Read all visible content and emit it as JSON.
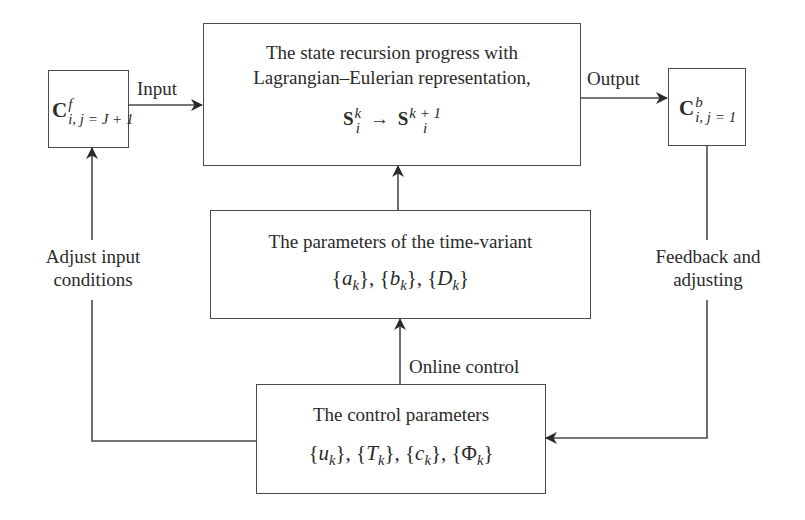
{
  "diagram": {
    "nodes": {
      "input_node": {
        "symbol": "C",
        "superscript": "f",
        "subscript": "i, j = J + 1"
      },
      "state_recursion": {
        "line1": "The state recursion progress with",
        "line2": "Lagrangian–Eulerian representation,",
        "formula_lhs": "S",
        "formula_lhs_sup": "k",
        "formula_lhs_sub": "i",
        "formula_arrow": "→",
        "formula_rhs": "S",
        "formula_rhs_sup": "k + 1",
        "formula_rhs_sub": "i"
      },
      "output_node": {
        "symbol": "C",
        "superscript": "b",
        "subscript": "i, j = 1"
      },
      "time_variant_params": {
        "title": "The parameters of the time-variant",
        "params": "{a_k}, {b_k}, {D_k}",
        "param_list": [
          {
            "symbol": "a",
            "sub": "k"
          },
          {
            "symbol": "b",
            "sub": "k"
          },
          {
            "symbol": "D",
            "sub": "k"
          }
        ]
      },
      "control_params": {
        "title": "The control parameters",
        "params": "{u_k}, {T_k}, {c_k}, {Φ_k}",
        "param_list": [
          {
            "symbol": "u",
            "sub": "k"
          },
          {
            "symbol": "T",
            "sub": "k"
          },
          {
            "symbol": "c",
            "sub": "k"
          },
          {
            "symbol": "Φ",
            "sub": "k"
          }
        ]
      }
    },
    "edge_labels": {
      "input": "Input",
      "output": "Output",
      "online_control": "Online control",
      "adjust_input_line1": "Adjust input",
      "adjust_input_line2": "conditions",
      "feedback_line1": "Feedback and",
      "feedback_line2": "adjusting"
    },
    "edges": [
      {
        "from": "input_node",
        "to": "state_recursion",
        "label": "Input"
      },
      {
        "from": "state_recursion",
        "to": "output_node",
        "label": "Output"
      },
      {
        "from": "time_variant_params",
        "to": "state_recursion",
        "label": ""
      },
      {
        "from": "control_params",
        "to": "time_variant_params",
        "label": "Online control"
      },
      {
        "from": "output_node",
        "to": "control_params",
        "label": "Feedback and adjusting"
      },
      {
        "from": "control_params",
        "to": "input_node",
        "label": "Adjust input conditions"
      }
    ],
    "colors": {
      "line": "#4a4a4a",
      "text": "#2a2a2a",
      "background": "#ffffff"
    }
  }
}
